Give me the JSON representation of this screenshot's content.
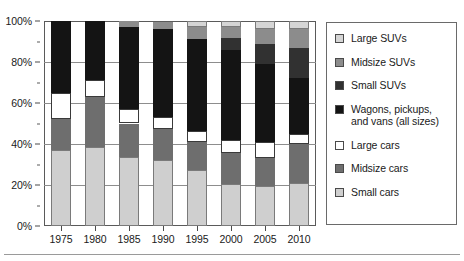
{
  "chart": {
    "type": "stacked-bar-100",
    "y_axis": {
      "label": "",
      "ticks": [
        "0%",
        "20%",
        "40%",
        "60%",
        "80%",
        "100%"
      ],
      "tick_values": [
        0,
        20,
        40,
        60,
        80,
        100
      ],
      "min": 0,
      "max": 100
    },
    "x_axis": {
      "label": "",
      "categories": [
        "1975",
        "1980",
        "1985",
        "1990",
        "1995",
        "2000",
        "2005",
        "2010"
      ]
    },
    "legend": {
      "position": "right",
      "items": [
        {
          "label": "Large SUVs",
          "swatch": "#d5d5d5"
        },
        {
          "label": "Midsize SUVs",
          "swatch": "#8c8c8c"
        },
        {
          "label": "Small SUVs",
          "swatch": "#313131"
        },
        {
          "label": "Wagons, pickups, and vans (all sizes)",
          "swatch": "#141414"
        },
        {
          "label": "Large cars",
          "swatch": "#ffffff"
        },
        {
          "label": "Midsize cars",
          "swatch": "#6e6e6e"
        },
        {
          "label": "Small cars",
          "swatch": "#cfcfcf"
        }
      ]
    }
  },
  "chart_data": {
    "type": "bar",
    "title": "",
    "xlabel": "",
    "ylabel": "",
    "ylim": [
      0,
      100
    ],
    "grid": true,
    "stacked": true,
    "normalized_percent": true,
    "legend_position": "right",
    "categories": [
      "1975",
      "1980",
      "1985",
      "1990",
      "1995",
      "2000",
      "2005",
      "2010"
    ],
    "series": [
      {
        "name": "Small cars",
        "color": "#cfcfcf",
        "values": [
          37.0,
          38.5,
          33.5,
          32.0,
          27.5,
          20.5,
          19.5,
          21.0
        ]
      },
      {
        "name": "Midsize cars",
        "color": "#6e6e6e",
        "values": [
          15.0,
          24.5,
          16.5,
          15.5,
          13.5,
          15.0,
          13.5,
          19.0
        ]
      },
      {
        "name": "Large cars",
        "color": "#ffffff",
        "values": [
          13.0,
          8.0,
          7.0,
          5.5,
          5.5,
          6.5,
          8.0,
          5.0
        ]
      },
      {
        "name": "Wagons, pickups, and vans (all sizes)",
        "color": "#141414",
        "values": [
          35.0,
          29.0,
          40.0,
          43.0,
          44.5,
          44.0,
          38.0,
          27.0
        ]
      },
      {
        "name": "Small SUVs",
        "color": "#313131",
        "values": [
          0.0,
          0.0,
          0.0,
          0.0,
          0.0,
          5.5,
          10.0,
          15.0
        ]
      },
      {
        "name": "Midsize SUVs",
        "color": "#8c8c8c",
        "values": [
          0.0,
          0.0,
          3.0,
          3.5,
          6.0,
          5.5,
          7.0,
          9.0
        ]
      },
      {
        "name": "Large SUVs",
        "color": "#d5d5d5",
        "values": [
          0.0,
          0.0,
          0.0,
          0.0,
          3.0,
          3.0,
          4.0,
          4.0
        ]
      }
    ]
  }
}
